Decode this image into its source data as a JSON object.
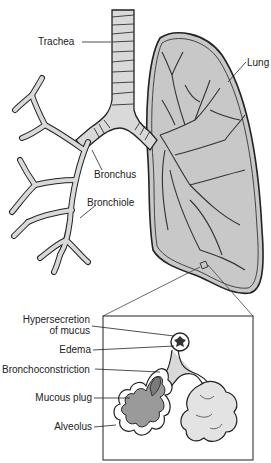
{
  "diagram": {
    "labels": {
      "trachea": "Trachea",
      "lung": "Lung",
      "bronchus": "Bronchus",
      "bronchiole": "Bronchiole",
      "hypersecretion_line1": "Hypersecretion",
      "hypersecretion_line2": "of mucus",
      "edema": "Edema",
      "bronchoconstriction": "Bronchoconstriction",
      "mucous_plug": "Mucous plug",
      "alveolus": "Alveolus"
    },
    "colors": {
      "airway_fill": "#d9d9d9",
      "lung_fill": "#c8c8c8",
      "outline": "#222222",
      "plug_fill": "#9a9a9a",
      "background": "#ffffff"
    }
  }
}
